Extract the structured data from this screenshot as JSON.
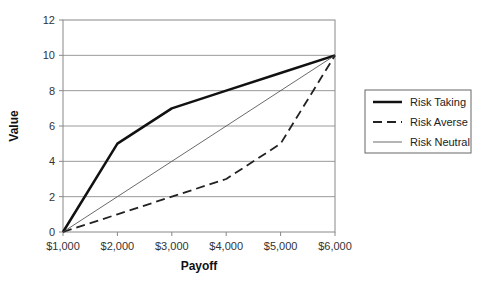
{
  "chart_data": {
    "type": "line",
    "title": "",
    "xlabel": "Payoff",
    "ylabel": "Value",
    "categories": [
      "$1,000",
      "$2,000",
      "$3,000",
      "$4,000",
      "$5,000",
      "$6,000"
    ],
    "x": [
      1000,
      2000,
      3000,
      4000,
      5000,
      6000
    ],
    "series": [
      {
        "name": "Risk Taking",
        "values": [
          0,
          5,
          7,
          8,
          9,
          10
        ],
        "style": "thick-solid",
        "color": "#111111"
      },
      {
        "name": "Risk Averse",
        "values": [
          0,
          1,
          2,
          3,
          5,
          10
        ],
        "style": "dashed",
        "color": "#222222"
      },
      {
        "name": "Risk Neutral",
        "values": [
          0,
          2,
          4,
          6,
          8,
          10
        ],
        "style": "thin-solid",
        "color": "#444444"
      }
    ],
    "ylim": [
      0,
      12
    ],
    "yticks": [
      0,
      2,
      4,
      6,
      8,
      10,
      12
    ],
    "grid": true,
    "legend_position": "right"
  }
}
